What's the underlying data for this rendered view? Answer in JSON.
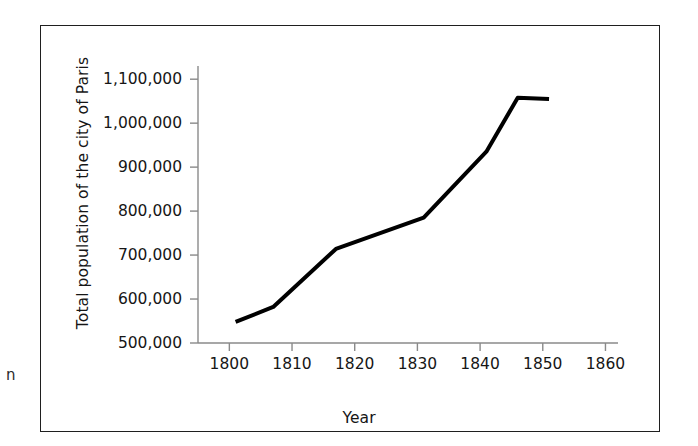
{
  "figure": {
    "page_artifact_glyph": "n",
    "frame_color": "#1f1f1f",
    "background_color": "#ffffff",
    "line_color": "#000000",
    "axis_color": "#8a8a8a",
    "text_color": "#161616"
  },
  "chart_data": {
    "type": "line",
    "title": "",
    "xlabel": "Year",
    "ylabel": "Total population of the city of Paris",
    "xlim": [
      1795,
      1862
    ],
    "ylim": [
      500000,
      1130000
    ],
    "xticks": [
      1800,
      1810,
      1820,
      1830,
      1840,
      1850,
      1860
    ],
    "xtick_labels": [
      "1800",
      "1810",
      "1820",
      "1830",
      "1840",
      "1850",
      "1860"
    ],
    "yticks": [
      500000,
      600000,
      700000,
      800000,
      900000,
      1000000,
      1100000
    ],
    "ytick_labels": [
      "500,000",
      "600,000",
      "700,000",
      "800,000",
      "900,000",
      "1,000,000",
      "1,100,000"
    ],
    "grid": false,
    "legend": false,
    "series": [
      {
        "name": "Total population of the city of Paris",
        "color": "#000000",
        "line_width": 4,
        "x": [
          1801,
          1807,
          1817,
          1831,
          1841,
          1846,
          1851
        ],
        "values": [
          548000,
          582000,
          714000,
          785000,
          935000,
          1058000,
          1055000
        ]
      }
    ]
  }
}
